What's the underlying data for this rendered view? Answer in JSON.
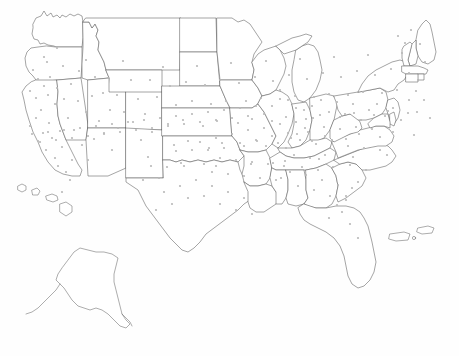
{
  "map": {
    "title": "United States dot distribution map",
    "background_color": "#fefefe",
    "outline_color": "#5a5a5a",
    "dot_color": "#b9b9b9",
    "dot_radius_px": 1.1,
    "projection_hint": "albers-usa-composite",
    "regions": [
      {
        "name": "contiguous-united-states",
        "has_dots": true
      },
      {
        "name": "alaska",
        "has_dots": false
      },
      {
        "name": "hawaii",
        "has_dots": false
      },
      {
        "name": "puerto-rico",
        "has_dots": false
      },
      {
        "name": "us-virgin-islands",
        "has_dots": false
      }
    ],
    "legend": null,
    "labels": [],
    "dots": [
      [
        44,
        57
      ],
      [
        57,
        48
      ],
      [
        47,
        62
      ],
      [
        33,
        70
      ],
      [
        38,
        79
      ],
      [
        44,
        86
      ],
      [
        30,
        91
      ],
      [
        36,
        98
      ],
      [
        48,
        95
      ],
      [
        55,
        104
      ],
      [
        41,
        110
      ],
      [
        36,
        118
      ],
      [
        49,
        123
      ],
      [
        30,
        126
      ],
      [
        43,
        133
      ],
      [
        38,
        141
      ],
      [
        52,
        138
      ],
      [
        46,
        150
      ],
      [
        55,
        158
      ],
      [
        62,
        147
      ],
      [
        58,
        166
      ],
      [
        66,
        172
      ],
      [
        72,
        160
      ],
      [
        60,
        131
      ],
      [
        68,
        118
      ],
      [
        64,
        99
      ],
      [
        57,
        88
      ],
      [
        50,
        77
      ],
      [
        63,
        66
      ],
      [
        71,
        84
      ],
      [
        78,
        101
      ],
      [
        74,
        130
      ],
      [
        82,
        145
      ],
      [
        88,
        160
      ],
      [
        94,
        139
      ],
      [
        99,
        121
      ],
      [
        86,
        112
      ],
      [
        92,
        96
      ],
      [
        79,
        71
      ],
      [
        86,
        60
      ],
      [
        95,
        77
      ],
      [
        103,
        93
      ],
      [
        110,
        110
      ],
      [
        104,
        133
      ],
      [
        112,
        150
      ],
      [
        118,
        128
      ],
      [
        124,
        112
      ],
      [
        117,
        95
      ],
      [
        108,
        78
      ],
      [
        123,
        61
      ],
      [
        131,
        80
      ],
      [
        138,
        99
      ],
      [
        133,
        122
      ],
      [
        141,
        140
      ],
      [
        148,
        157
      ],
      [
        152,
        132
      ],
      [
        145,
        114
      ],
      [
        157,
        97
      ],
      [
        150,
        80
      ],
      [
        163,
        67
      ],
      [
        170,
        86
      ],
      [
        176,
        105
      ],
      [
        168,
        124
      ],
      [
        174,
        145
      ],
      [
        181,
        163
      ],
      [
        188,
        141
      ],
      [
        183,
        120
      ],
      [
        192,
        101
      ],
      [
        186,
        82
      ],
      [
        197,
        66
      ],
      [
        205,
        85
      ],
      [
        211,
        104
      ],
      [
        203,
        126
      ],
      [
        209,
        148
      ],
      [
        216,
        166
      ],
      [
        222,
        143
      ],
      [
        217,
        121
      ],
      [
        226,
        101
      ],
      [
        220,
        80
      ],
      [
        231,
        63
      ],
      [
        239,
        83
      ],
      [
        246,
        101
      ],
      [
        238,
        123
      ],
      [
        244,
        146
      ],
      [
        251,
        164
      ],
      [
        257,
        141
      ],
      [
        252,
        119
      ],
      [
        261,
        98
      ],
      [
        255,
        77
      ],
      [
        266,
        61
      ],
      [
        273,
        81
      ],
      [
        280,
        99
      ],
      [
        272,
        121
      ],
      [
        278,
        143
      ],
      [
        285,
        161
      ],
      [
        291,
        138
      ],
      [
        286,
        117
      ],
      [
        295,
        96
      ],
      [
        289,
        75
      ],
      [
        300,
        59
      ],
      [
        307,
        79
      ],
      [
        314,
        97
      ],
      [
        306,
        119
      ],
      [
        312,
        141
      ],
      [
        319,
        159
      ],
      [
        325,
        136
      ],
      [
        320,
        115
      ],
      [
        329,
        94
      ],
      [
        323,
        73
      ],
      [
        334,
        57
      ],
      [
        341,
        77
      ],
      [
        348,
        95
      ],
      [
        340,
        117
      ],
      [
        346,
        139
      ],
      [
        353,
        157
      ],
      [
        359,
        134
      ],
      [
        354,
        113
      ],
      [
        363,
        92
      ],
      [
        357,
        71
      ],
      [
        368,
        55
      ],
      [
        375,
        75
      ],
      [
        382,
        93
      ],
      [
        374,
        115
      ],
      [
        380,
        137
      ],
      [
        387,
        155
      ],
      [
        393,
        132
      ],
      [
        388,
        111
      ],
      [
        397,
        90
      ],
      [
        391,
        69
      ],
      [
        402,
        53
      ],
      [
        409,
        73
      ],
      [
        416,
        91
      ],
      [
        408,
        113
      ],
      [
        414,
        135
      ],
      [
        405,
        43
      ],
      [
        398,
        36
      ],
      [
        411,
        30
      ],
      [
        420,
        44
      ],
      [
        425,
        62
      ],
      [
        418,
        80
      ],
      [
        424,
        100
      ],
      [
        430,
        118
      ],
      [
        266,
        146
      ],
      [
        273,
        163
      ],
      [
        281,
        178
      ],
      [
        290,
        172
      ],
      [
        298,
        186
      ],
      [
        306,
        175
      ],
      [
        314,
        190
      ],
      [
        322,
        180
      ],
      [
        330,
        196
      ],
      [
        338,
        185
      ],
      [
        346,
        200
      ],
      [
        352,
        188
      ],
      [
        333,
        167
      ],
      [
        325,
        155
      ],
      [
        318,
        170
      ],
      [
        310,
        158
      ],
      [
        302,
        167
      ],
      [
        294,
        155
      ],
      [
        286,
        148
      ],
      [
        300,
        140
      ],
      [
        308,
        132
      ],
      [
        316,
        144
      ],
      [
        324,
        127
      ],
      [
        332,
        140
      ],
      [
        340,
        129
      ],
      [
        348,
        146
      ],
      [
        356,
        127
      ],
      [
        364,
        148
      ],
      [
        372,
        129
      ],
      [
        380,
        150
      ],
      [
        366,
        170
      ],
      [
        358,
        182
      ],
      [
        350,
        165
      ],
      [
        342,
        212
      ],
      [
        350,
        224
      ],
      [
        358,
        238
      ],
      [
        346,
        196
      ],
      [
        337,
        205
      ],
      [
        329,
        218
      ],
      [
        196,
        180
      ],
      [
        204,
        196
      ],
      [
        212,
        186
      ],
      [
        220,
        204
      ],
      [
        228,
        192
      ],
      [
        236,
        210
      ],
      [
        244,
        198
      ],
      [
        252,
        214
      ],
      [
        188,
        198
      ],
      [
        180,
        186
      ],
      [
        172,
        204
      ],
      [
        164,
        192
      ],
      [
        156,
        210
      ],
      [
        204,
        164
      ],
      [
        212,
        172
      ],
      [
        220,
        158
      ],
      [
        228,
        174
      ],
      [
        236,
        160
      ],
      [
        244,
        176
      ],
      [
        252,
        162
      ],
      [
        260,
        178
      ],
      [
        268,
        164
      ],
      [
        276,
        180
      ],
      [
        284,
        166
      ],
      [
        167,
        167
      ],
      [
        159,
        178
      ],
      [
        151,
        166
      ],
      [
        143,
        180
      ],
      [
        176,
        151
      ],
      [
        184,
        166
      ],
      [
        192,
        150
      ],
      [
        200,
        142
      ],
      [
        208,
        150
      ],
      [
        216,
        138
      ],
      [
        224,
        148
      ],
      [
        232,
        134
      ],
      [
        240,
        143
      ],
      [
        248,
        130
      ],
      [
        256,
        140
      ],
      [
        264,
        128
      ],
      [
        272,
        136
      ],
      [
        280,
        124
      ],
      [
        288,
        133
      ],
      [
        296,
        122
      ],
      [
        304,
        110
      ],
      [
        312,
        106
      ],
      [
        296,
        108
      ],
      [
        288,
        100
      ],
      [
        280,
        90
      ],
      [
        272,
        106
      ],
      [
        264,
        114
      ],
      [
        256,
        106
      ],
      [
        248,
        116
      ],
      [
        240,
        108
      ],
      [
        232,
        118
      ],
      [
        224,
        110
      ],
      [
        216,
        120
      ],
      [
        208,
        112
      ],
      [
        200,
        122
      ],
      [
        192,
        114
      ],
      [
        184,
        124
      ],
      [
        176,
        116
      ],
      [
        168,
        126
      ],
      [
        160,
        118
      ],
      [
        152,
        128
      ],
      [
        144,
        120
      ],
      [
        136,
        130
      ],
      [
        128,
        122
      ],
      [
        120,
        132
      ],
      [
        112,
        124
      ],
      [
        104,
        134
      ],
      [
        96,
        126
      ],
      [
        88,
        136
      ],
      [
        80,
        128
      ],
      [
        72,
        138
      ],
      [
        64,
        130
      ],
      [
        56,
        140
      ],
      [
        48,
        132
      ],
      [
        40,
        142
      ],
      [
        32,
        134
      ],
      [
        369,
        110
      ],
      [
        377,
        104
      ],
      [
        385,
        116
      ],
      [
        393,
        108
      ],
      [
        401,
        120
      ],
      [
        409,
        100
      ],
      [
        417,
        112
      ],
      [
        361,
        120
      ],
      [
        353,
        104
      ],
      [
        345,
        114
      ],
      [
        337,
        102
      ],
      [
        329,
        112
      ],
      [
        321,
        100
      ],
      [
        313,
        118
      ],
      [
        305,
        128
      ],
      [
        297,
        134
      ],
      [
        62,
        192
      ],
      [
        70,
        180
      ]
    ]
  }
}
